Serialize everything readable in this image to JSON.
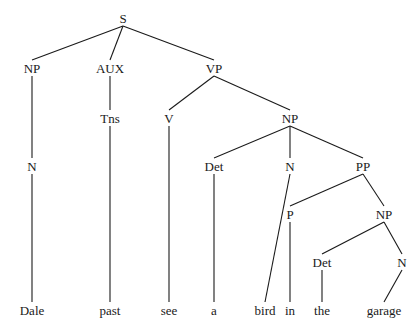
{
  "diagram": {
    "type": "syntax-tree",
    "nodes": [
      {
        "id": "S",
        "label": "S",
        "x": 123,
        "y": 18
      },
      {
        "id": "NP1",
        "label": "NP",
        "x": 32,
        "y": 68
      },
      {
        "id": "AUX",
        "label": "AUX",
        "x": 110,
        "y": 68
      },
      {
        "id": "VP",
        "label": "VP",
        "x": 214,
        "y": 68
      },
      {
        "id": "N1",
        "label": "N",
        "x": 32,
        "y": 166
      },
      {
        "id": "Tns",
        "label": "Tns",
        "x": 110,
        "y": 118
      },
      {
        "id": "V",
        "label": "V",
        "x": 169,
        "y": 118
      },
      {
        "id": "NP2",
        "label": "NP",
        "x": 290,
        "y": 118
      },
      {
        "id": "Det1",
        "label": "Det",
        "x": 214,
        "y": 166
      },
      {
        "id": "N2",
        "label": "N",
        "x": 290,
        "y": 166
      },
      {
        "id": "PP",
        "label": "PP",
        "x": 363,
        "y": 166
      },
      {
        "id": "P",
        "label": "P",
        "x": 290,
        "y": 214
      },
      {
        "id": "NP3",
        "label": "NP",
        "x": 384,
        "y": 214
      },
      {
        "id": "Det2",
        "label": "Det",
        "x": 322,
        "y": 262
      },
      {
        "id": "N3",
        "label": "N",
        "x": 402,
        "y": 262
      },
      {
        "id": "w1",
        "label": "Dale",
        "x": 32,
        "y": 310
      },
      {
        "id": "w2",
        "label": "past",
        "x": 110,
        "y": 310
      },
      {
        "id": "w3",
        "label": "see",
        "x": 169,
        "y": 310
      },
      {
        "id": "w4",
        "label": "a",
        "x": 214,
        "y": 310
      },
      {
        "id": "w5",
        "label": "bird",
        "x": 265,
        "y": 310
      },
      {
        "id": "w6",
        "label": "in",
        "x": 290,
        "y": 310
      },
      {
        "id": "w7",
        "label": "the",
        "x": 322,
        "y": 310
      },
      {
        "id": "w8",
        "label": "garage",
        "x": 384,
        "y": 310
      }
    ],
    "edges": [
      [
        "S",
        "NP1"
      ],
      [
        "S",
        "AUX"
      ],
      [
        "S",
        "VP"
      ],
      [
        "NP1",
        "N1"
      ],
      [
        "N1",
        "w1"
      ],
      [
        "AUX",
        "Tns"
      ],
      [
        "Tns",
        "w2"
      ],
      [
        "VP",
        "V"
      ],
      [
        "VP",
        "NP2"
      ],
      [
        "V",
        "w3"
      ],
      [
        "NP2",
        "Det1"
      ],
      [
        "NP2",
        "N2"
      ],
      [
        "NP2",
        "PP"
      ],
      [
        "Det1",
        "w4"
      ],
      [
        "N2",
        "w5"
      ],
      [
        "PP",
        "P"
      ],
      [
        "PP",
        "NP3"
      ],
      [
        "P",
        "w6"
      ],
      [
        "NP3",
        "Det2"
      ],
      [
        "NP3",
        "N3"
      ],
      [
        "Det2",
        "w7"
      ],
      [
        "N3",
        "w8"
      ]
    ],
    "sentence": "Dale past see a bird in the garage"
  }
}
